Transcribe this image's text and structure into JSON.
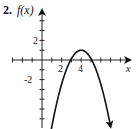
{
  "problem_number": "2.",
  "chart_data": {
    "type": "line",
    "title": "",
    "ylabel": "f(x)",
    "xlabel": "x",
    "function": "f(x) = -(x-4)^2 + 1",
    "vertex": [
      4,
      1
    ],
    "x_intercepts": [
      3,
      5
    ],
    "x_tick_labels": [
      "2",
      "4"
    ],
    "y_tick_labels": [
      "2",
      "-2"
    ],
    "xlim": [
      -3,
      9
    ],
    "ylim": [
      -6,
      4
    ],
    "grid": false,
    "arrows_on_curve_ends": true,
    "series": [
      {
        "name": "f(x)",
        "x": [
          0.8,
          1.5,
          2,
          2.5,
          3,
          3.5,
          4,
          4.5,
          5,
          5.5,
          6,
          6.5,
          7.2
        ],
        "values": [
          -5.8,
          -5.25,
          -3,
          -1.25,
          0,
          0.75,
          1,
          0.75,
          0,
          -1.25,
          -3,
          -5.25,
          -5.8
        ]
      }
    ]
  }
}
